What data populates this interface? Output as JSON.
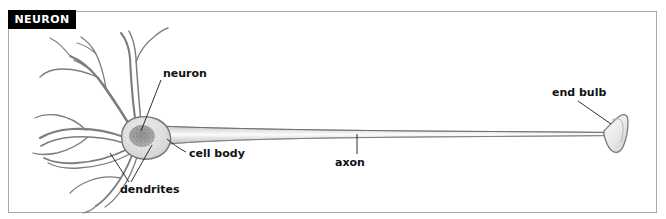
{
  "figure": {
    "title": "NEURON",
    "title_bg_color": "#000000",
    "title_text_color": "#ffffff",
    "border_color": "#a8a8a8",
    "background_color": "#ffffff",
    "ink_color": "#6f6f6f",
    "leader_color": "#1a1a1a",
    "width": 666,
    "height": 219
  },
  "labels": {
    "neuron": "neuron",
    "cell_body": "cell body",
    "dendrites": "dendrites",
    "axon": "axon",
    "end_bulb": "end bulb"
  },
  "diagram": {
    "type": "labeled-biological-illustration",
    "parts": [
      {
        "name": "dendrites",
        "label": "dendrites",
        "description": "Branching tapered processes radiating up, left and down from the cell body; receive incoming signals.",
        "label_position": {
          "x": 120,
          "y": 183
        },
        "leader_targets": [
          {
            "x": 151,
            "y": 146
          },
          {
            "x": 150,
            "y": 154
          }
        ]
      },
      {
        "name": "cell-body",
        "label": "cell body",
        "description": "Oval soma with a darker stippled nucleus where dendrites converge.",
        "label_position": {
          "x": 189,
          "y": 147
        },
        "center": {
          "x": 143,
          "y": 140
        },
        "radius_x": 22,
        "radius_y": 17
      },
      {
        "name": "neuron",
        "label": "neuron",
        "description": "Overall name of the whole nerve cell; leader points to the cell body.",
        "label_position": {
          "x": 163,
          "y": 67
        },
        "leader_target": {
          "x": 142,
          "y": 133
        }
      },
      {
        "name": "axon",
        "label": "axon",
        "description": "Long thin tube carrying the nerve impulse from the cell body to the end bulb.",
        "label_position": {
          "x": 335,
          "y": 156
        },
        "leader_target": {
          "x": 357,
          "y": 134
        },
        "start_x": 165,
        "end_x": 606
      },
      {
        "name": "end-bulb",
        "label": "end bulb",
        "description": "Flared trumpet-shaped terminal at the far end of the axon.",
        "label_position": {
          "x": 552,
          "y": 86
        },
        "leader_target": {
          "x": 612,
          "y": 124
        },
        "center": {
          "x": 616,
          "y": 133
        }
      }
    ]
  }
}
